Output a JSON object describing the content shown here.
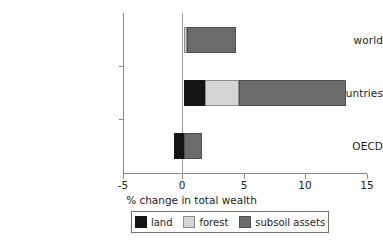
{
  "chart_data": {
    "type": "bar",
    "orientation": "horizontal",
    "stacked": true,
    "title": "",
    "xlabel": "% change in total wealth",
    "ylabel": "",
    "xlim": [
      -5,
      15
    ],
    "xticks": [
      -5,
      0,
      5,
      10,
      15
    ],
    "xticklabels": [
      "-5",
      "0",
      "5",
      "10",
      "15"
    ],
    "grid": false,
    "legend_position": "bottom",
    "categories": [
      "world",
      "developing countries",
      "OECD"
    ],
    "series": [
      {
        "name": "land",
        "color": "#141414",
        "values": [
          0.0,
          1.7,
          -0.8
        ]
      },
      {
        "name": "forest",
        "color": "#d5d5d5",
        "values": [
          0.25,
          2.8,
          0.0
        ]
      },
      {
        "name": "subsoil assets",
        "color": "#6b6b6b",
        "values": [
          4.05,
          8.8,
          1.5
        ]
      }
    ],
    "totals": [
      4.3,
      13.3,
      0.7
    ],
    "bar_extents": [
      {
        "category": "world",
        "start": 0.0,
        "end": 4.3
      },
      {
        "category": "developing countries",
        "start": 0.0,
        "end": 13.3
      },
      {
        "category": "OECD",
        "start": -0.8,
        "end": 1.5
      }
    ]
  },
  "axes": {
    "x_title": "% change in total wealth",
    "x_ticks": [
      {
        "label": "-5",
        "value": -5
      },
      {
        "label": "0",
        "value": 0
      },
      {
        "label": "5",
        "value": 5
      },
      {
        "label": "10",
        "value": 10
      },
      {
        "label": "15",
        "value": 15
      }
    ],
    "y_ticks": [
      {
        "label": "world"
      },
      {
        "label": "developing countries"
      },
      {
        "label": "OECD"
      }
    ]
  },
  "legend": {
    "items": [
      {
        "label": "land",
        "color": "#141414"
      },
      {
        "label": "forest",
        "color": "#d5d5d5"
      },
      {
        "label": "subsoil assets",
        "color": "#6b6b6b"
      }
    ]
  }
}
